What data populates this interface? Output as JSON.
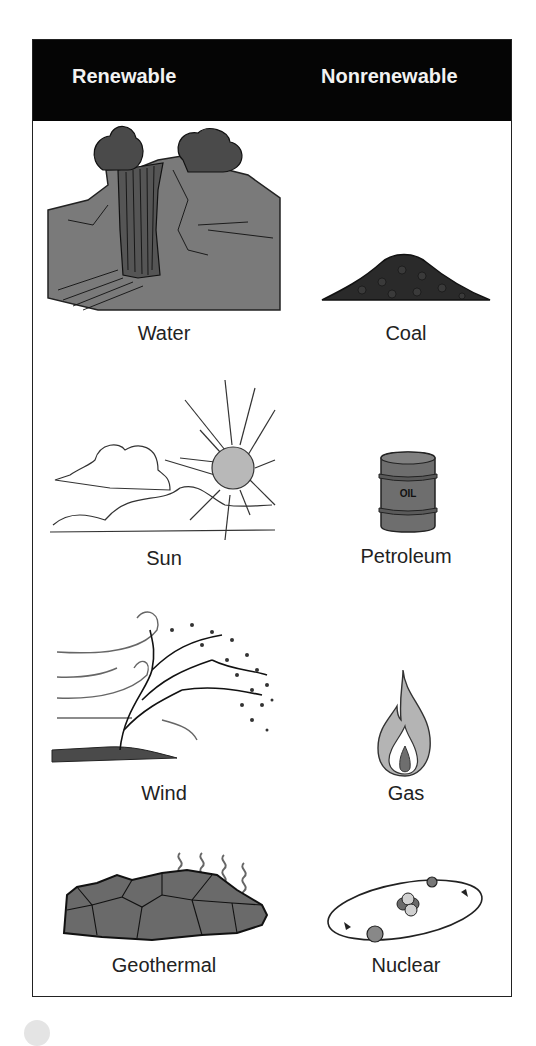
{
  "header": {
    "left_column": "Renewable",
    "right_column": "Nonrenewable"
  },
  "renewable": [
    {
      "label": "Water",
      "icon": "waterfall-icon"
    },
    {
      "label": "Sun",
      "icon": "sun-icon"
    },
    {
      "label": "Wind",
      "icon": "windblown-tree-icon"
    },
    {
      "label": "Geothermal",
      "icon": "geothermal-rock-icon"
    }
  ],
  "nonrenewable": [
    {
      "label": "Coal",
      "icon": "coal-pile-icon"
    },
    {
      "label": "Petroleum",
      "icon": "oil-barrel-icon",
      "barrel_text": "OIL"
    },
    {
      "label": "Gas",
      "icon": "flame-icon"
    },
    {
      "label": "Nuclear",
      "icon": "atom-icon"
    }
  ],
  "colors": {
    "header_bg": "#050505",
    "header_text": "#f2f2f2",
    "illustration_gray": "#6e6e6e",
    "light_gray": "#b8b8b8"
  }
}
